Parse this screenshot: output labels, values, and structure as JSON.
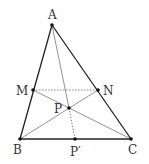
{
  "diagram": {
    "type": "triangle-geometry",
    "points": {
      "A": {
        "label": "A",
        "x": 52,
        "y": 25
      },
      "B": {
        "label": "B",
        "x": 20,
        "y": 139
      },
      "C": {
        "label": "C",
        "x": 131,
        "y": 139
      },
      "M": {
        "label": "M",
        "x": 33,
        "y": 90
      },
      "N": {
        "label": "N",
        "x": 98,
        "y": 90
      },
      "P": {
        "label": "P",
        "x": 69,
        "y": 108
      },
      "P2": {
        "label": "P′",
        "x": 75,
        "y": 139
      }
    },
    "segments": [
      {
        "from": "A",
        "to": "B",
        "style": "solid-bold"
      },
      {
        "from": "A",
        "to": "C",
        "style": "solid-bold"
      },
      {
        "from": "B",
        "to": "C",
        "style": "solid-bold"
      },
      {
        "from": "M",
        "to": "N",
        "style": "dotted"
      },
      {
        "from": "M",
        "to": "C",
        "style": "solid-thin"
      },
      {
        "from": "B",
        "to": "N",
        "style": "solid-thin"
      },
      {
        "from": "A",
        "to": "P",
        "style": "solid-thin"
      },
      {
        "from": "P",
        "to": "P2",
        "style": "dotted"
      }
    ]
  }
}
